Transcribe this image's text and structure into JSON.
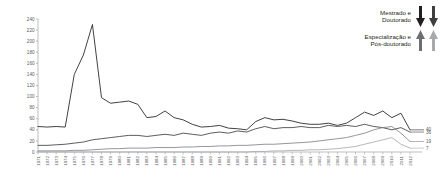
{
  "legend": {
    "groups": [
      {
        "name": "mestrado-doutorado",
        "lines": [
          "Mestrado e",
          "Doutorado"
        ],
        "arrow_direction": "down",
        "arrow_colors": [
          "#231f20",
          "#3f3f3f"
        ]
      },
      {
        "name": "especializacao-pos-doutorado",
        "lines": [
          "Especialização e",
          "Pós-doutorado"
        ],
        "arrow_direction": "up",
        "arrow_colors": [
          "#6d6e71",
          "#a7a9ac"
        ]
      }
    ]
  },
  "chart_data": {
    "type": "line",
    "title": "",
    "xlabel": "",
    "ylabel": "",
    "ylim": [
      0,
      240
    ],
    "ytick_step": 20,
    "yticks": [
      0,
      20,
      40,
      60,
      80,
      100,
      120,
      140,
      160,
      180,
      200,
      220,
      240
    ],
    "grid": false,
    "legend_position": "top-right",
    "x": [
      1971,
      1972,
      1973,
      1974,
      1975,
      1976,
      1977,
      1978,
      1979,
      1980,
      1981,
      1982,
      1983,
      1984,
      1985,
      1986,
      1987,
      1988,
      1989,
      1990,
      1991,
      1992,
      1993,
      1994,
      1995,
      1996,
      1997,
      1998,
      1999,
      2000,
      2001,
      2002,
      2003,
      2004,
      2005,
      2006,
      2007,
      2008,
      2009,
      2010,
      2011,
      2012
    ],
    "series": [
      {
        "name": "Mestrado",
        "color": "#231f20",
        "end_label": "40",
        "values": [
          46,
          45,
          46,
          45,
          140,
          175,
          230,
          98,
          88,
          90,
          92,
          86,
          62,
          64,
          74,
          62,
          58,
          50,
          45,
          46,
          48,
          43,
          42,
          40,
          55,
          62,
          58,
          59,
          56,
          52,
          50,
          50,
          52,
          48,
          52,
          62,
          72,
          66,
          74,
          62,
          70,
          40
        ]
      },
      {
        "name": "Doutorado",
        "color": "#404041",
        "end_label": "36",
        "values": [
          12,
          12,
          13,
          14,
          16,
          18,
          22,
          24,
          26,
          28,
          30,
          30,
          28,
          30,
          32,
          30,
          34,
          32,
          30,
          34,
          36,
          34,
          38,
          36,
          42,
          46,
          42,
          44,
          44,
          46,
          44,
          44,
          48,
          46,
          48,
          46,
          50,
          46,
          44,
          40,
          44,
          36
        ]
      },
      {
        "name": "Especialização",
        "color": "#808285",
        "end_label": "19",
        "values": [
          2,
          2,
          2,
          2,
          3,
          3,
          4,
          5,
          6,
          6,
          7,
          7,
          7,
          8,
          8,
          8,
          9,
          9,
          10,
          10,
          11,
          11,
          12,
          12,
          13,
          14,
          14,
          15,
          16,
          17,
          18,
          20,
          22,
          24,
          26,
          30,
          34,
          40,
          44,
          46,
          34,
          19
        ]
      },
      {
        "name": "Pós-doutorado",
        "color": "#a7a9ac",
        "end_label": "7",
        "values": [
          0,
          0,
          0,
          0,
          0,
          0,
          0,
          0,
          0,
          0,
          0,
          0,
          0,
          0,
          0,
          0,
          0,
          0,
          0,
          0,
          0,
          0,
          0,
          0,
          1,
          1,
          2,
          2,
          3,
          3,
          4,
          4,
          5,
          6,
          8,
          10,
          14,
          18,
          22,
          26,
          14,
          7
        ]
      }
    ]
  }
}
